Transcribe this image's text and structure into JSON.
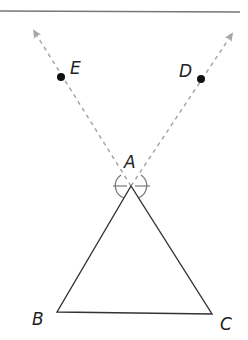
{
  "diagram": {
    "type": "geometry-construction",
    "colors": {
      "stroke": "#333333",
      "dashed_ray": "#a6a6a6",
      "construction_arc": "#7a7a7a",
      "point": "#111111",
      "top_rule": "#777777"
    },
    "points": {
      "A": {
        "label": "A",
        "x": 131,
        "y": 186
      },
      "B": {
        "label": "B",
        "x": 57,
        "y": 312
      },
      "C": {
        "label": "C",
        "x": 212,
        "y": 314
      },
      "D": {
        "label": "D",
        "x": 201,
        "y": 79
      },
      "E": {
        "label": "E",
        "x": 61,
        "y": 77
      }
    },
    "triangle": {
      "vertices": [
        "A",
        "B",
        "C"
      ]
    },
    "rays": [
      {
        "from": "A",
        "through": "E",
        "style": "dashed-arrow"
      },
      {
        "from": "A",
        "through": "D",
        "style": "dashed-arrow"
      }
    ],
    "construction": {
      "center": "A",
      "arc": "circle-around-vertex",
      "tick_marks": 2
    }
  }
}
